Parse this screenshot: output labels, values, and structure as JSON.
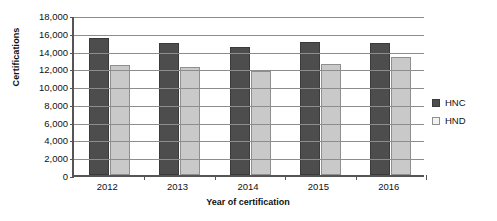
{
  "chart_data": {
    "type": "bar",
    "title": "",
    "xlabel": "Year of certification",
    "ylabel": "Certifications",
    "categories": [
      "2012",
      "2013",
      "2014",
      "2015",
      "2016"
    ],
    "series": [
      {
        "name": "HNC",
        "color": "#4d4d4d",
        "values": [
          15400,
          14900,
          14400,
          15000,
          14800
        ]
      },
      {
        "name": "HND",
        "color": "#c9c9c9",
        "values": [
          12400,
          12200,
          11700,
          12500,
          13300
        ]
      }
    ],
    "ylim": [
      0,
      18000
    ],
    "ytick_step": 2000,
    "ytick_labels": [
      "18,000",
      "16,000",
      "14,000",
      "12,000",
      "10,000",
      "8,000",
      "6,000",
      "4,000",
      "2,000",
      "0"
    ],
    "ytick_values": [
      18000,
      16000,
      14000,
      12000,
      10000,
      8000,
      6000,
      4000,
      2000,
      0
    ],
    "grid": true,
    "legend_position": "right"
  },
  "legend": {
    "items": [
      {
        "label": "HNC",
        "swatch": "hnc-swatch-icon"
      },
      {
        "label": "HND",
        "swatch": "hnd-swatch-icon"
      }
    ]
  }
}
